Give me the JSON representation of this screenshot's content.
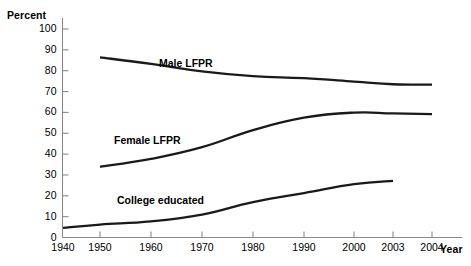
{
  "chart_data": {
    "type": "line",
    "title": "",
    "xlabel": "Year",
    "ylabel": "Percent",
    "ylim": [
      0,
      100
    ],
    "ytick_values": [
      0,
      10,
      20,
      30,
      40,
      50,
      60,
      70,
      80,
      90,
      100
    ],
    "ytick_labels": [
      "0",
      "10",
      "20",
      "30",
      "40",
      "50",
      "60",
      "70",
      "80",
      "90",
      "100"
    ],
    "xtick_labels": [
      "1940",
      "1950",
      "1960",
      "1970",
      "1980",
      "1990",
      "2000",
      "2003",
      "2004"
    ],
    "xtick_values": [
      1940,
      1950,
      1960,
      1970,
      1980,
      1990,
      2000,
      2003,
      2004
    ],
    "grid": false,
    "legend_position": "inline-annotations",
    "series": [
      {
        "name": "Male LFPR",
        "label": "Male LFPR",
        "color": "#1a1a1a",
        "x": [
          1950,
          1960,
          1970,
          1980,
          1990,
          2000,
          2003,
          2004
        ],
        "values": [
          86.4,
          83.3,
          79.7,
          77.4,
          76.4,
          74.8,
          73.5,
          73.3
        ]
      },
      {
        "name": "Female LFPR",
        "label": "Female LFPR",
        "color": "#1a1a1a",
        "x": [
          1950,
          1960,
          1970,
          1980,
          1990,
          2000,
          2003,
          2004
        ],
        "values": [
          33.9,
          37.7,
          43.3,
          51.5,
          57.5,
          59.9,
          59.5,
          59.2
        ]
      },
      {
        "name": "College educated",
        "label": "College educated",
        "color": "#1a1a1a",
        "x": [
          1940,
          1950,
          1960,
          1970,
          1980,
          1990,
          2000,
          2003
        ],
        "values": [
          4.6,
          6.2,
          7.7,
          11.0,
          17.0,
          21.3,
          25.6,
          27.2
        ]
      }
    ],
    "annotations": [
      {
        "text": "Male LFPR",
        "x_px": 159,
        "y_px": 57
      },
      {
        "text": "Female LFPR",
        "x_px": 114,
        "y_px": 134
      },
      {
        "text": "College educated",
        "x_px": 117,
        "y_px": 194
      }
    ]
  },
  "axes": {
    "y_title": "Percent",
    "x_title": "Year"
  }
}
